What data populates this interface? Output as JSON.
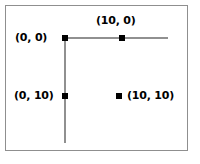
{
  "diagram": {
    "background_color": "#ffffff",
    "frame_border_color": "#8f8f8f",
    "axis_color": "#909090",
    "marker_color": "#000000",
    "label_color": "#000000",
    "axes": {
      "horizontal": {
        "label": "horizontal-axis-line"
      },
      "vertical": {
        "label": "vertical-axis-line"
      }
    },
    "points": [
      {
        "label": "(0, 0)",
        "x": 0,
        "y": 0,
        "label_position": "left"
      },
      {
        "label": "(10, 0)",
        "x": 10,
        "y": 0,
        "label_position": "above"
      },
      {
        "label": "(0, 10)",
        "x": 0,
        "y": 10,
        "label_position": "left"
      },
      {
        "label": "(10, 10)",
        "x": 10,
        "y": 10,
        "label_position": "right"
      }
    ]
  }
}
